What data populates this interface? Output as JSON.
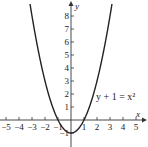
{
  "chart_data": {
    "type": "line",
    "title": "",
    "equation_label": "y + 1 = x²",
    "xlabel": "x",
    "ylabel": "y",
    "xlim": [
      -5.5,
      5.5
    ],
    "ylim": [
      -1.5,
      8.8
    ],
    "x_ticks": [
      -5,
      -4,
      -3,
      -2,
      -1,
      1,
      2,
      3,
      4,
      5
    ],
    "x_tick_labels": [
      "−5",
      "−4",
      "−3",
      "−2",
      "−1",
      "1",
      "2",
      "3",
      "4",
      "5"
    ],
    "y_ticks": [
      -1,
      1,
      2,
      3,
      4,
      5,
      6,
      7,
      8
    ],
    "y_tick_labels": [
      "−1",
      "1",
      "2",
      "3",
      "4",
      "5",
      "6",
      "7",
      "8"
    ],
    "grid": false,
    "series": [
      {
        "name": "y + 1 = x²",
        "function": "y = x^2 - 1",
        "x": [
          -3,
          -2.5,
          -2,
          -1.5,
          -1,
          -0.5,
          0,
          0.5,
          1,
          1.5,
          2,
          2.5,
          3
        ],
        "values": [
          8,
          5.25,
          3,
          1.25,
          0,
          -0.75,
          -1,
          -0.75,
          0,
          1.25,
          3,
          5.25,
          8
        ]
      }
    ],
    "colors": {
      "curve": "#222222",
      "axes": "#333333"
    }
  }
}
